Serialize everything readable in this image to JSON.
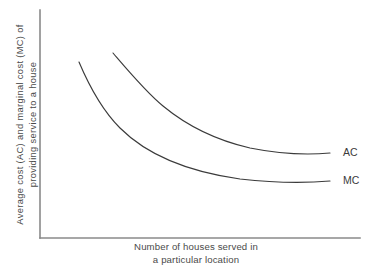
{
  "chart_data": {
    "type": "line",
    "title": "",
    "xlabel": "Number of houses served in a particular location",
    "ylabel": "Average cost (AC) and marginal cost (MC) of providing service to a house",
    "xlabel_lines": [
      "Number of houses served in",
      "a particular location"
    ],
    "ylabel_lines": [
      "Average cost (AC) and  marginal cost (MC) of",
      "providing service to a house"
    ],
    "grid": false,
    "legend_position": "right-of-curve-end",
    "axes": {
      "x_tick_labels": [],
      "y_tick_labels": [],
      "xlim": [
        0,
        100
      ],
      "ylim": [
        0,
        100
      ],
      "x_axis_path": "M 40 238 L 360 238",
      "y_axis_path": "M 40 10 L 40 238"
    },
    "series": [
      {
        "name": "AC",
        "label": "AC",
        "label_x": 343,
        "label_y": 155,
        "color": "#3b3b3b",
        "path": "M 113 53 C 131 74, 146 92, 163 106 C 186 125, 215 140, 250 148 C 280 154, 308 155, 330 153",
        "points": [
          {
            "x": 113,
            "y": 53
          },
          {
            "x": 140,
            "y": 82
          },
          {
            "x": 163,
            "y": 106
          },
          {
            "x": 200,
            "y": 130
          },
          {
            "x": 250,
            "y": 148
          },
          {
            "x": 290,
            "y": 153
          },
          {
            "x": 330,
            "y": 153
          }
        ]
      },
      {
        "name": "MC",
        "label": "MC",
        "label_x": 343,
        "label_y": 183,
        "color": "#3b3b3b",
        "path": "M 79 62 C 90 88, 103 111, 120 128 C 148 156, 190 172, 240 179 C 275 183, 308 183, 330 181",
        "points": [
          {
            "x": 79,
            "y": 62
          },
          {
            "x": 104,
            "y": 112
          },
          {
            "x": 120,
            "y": 128
          },
          {
            "x": 160,
            "y": 156
          },
          {
            "x": 210,
            "y": 173
          },
          {
            "x": 270,
            "y": 181
          },
          {
            "x": 330,
            "y": 181
          }
        ]
      }
    ],
    "annotations": [
      {
        "text": "AC",
        "x": 343,
        "y": 155
      },
      {
        "text": "MC",
        "x": 343,
        "y": 183
      }
    ]
  }
}
